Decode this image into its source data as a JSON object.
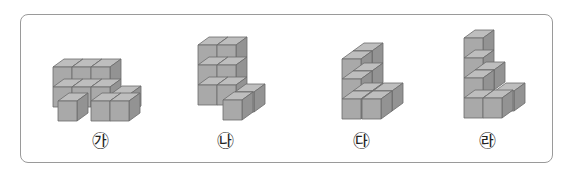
{
  "figures": [
    {
      "label": "㉮",
      "label_x": 100,
      "cubes": [
        {
          "x": 53,
          "y": 67
        },
        {
          "x": 72,
          "y": 67
        },
        {
          "x": 91,
          "y": 67
        },
        {
          "x": 53,
          "y": 87
        },
        {
          "x": 72,
          "y": 87
        },
        {
          "x": 91,
          "y": 87
        },
        {
          "x": 111,
          "y": 94
        },
        {
          "x": 58,
          "y": 101
        },
        {
          "x": 91,
          "y": 101
        },
        {
          "x": 110,
          "y": 101
        }
      ]
    },
    {
      "label": "㉯",
      "label_x": 225,
      "cubes": [
        {
          "x": 198,
          "y": 45
        },
        {
          "x": 217,
          "y": 45
        },
        {
          "x": 198,
          "y": 65
        },
        {
          "x": 217,
          "y": 65
        },
        {
          "x": 198,
          "y": 85
        },
        {
          "x": 217,
          "y": 85
        },
        {
          "x": 235,
          "y": 92
        },
        {
          "x": 223,
          "y": 100
        }
      ]
    },
    {
      "label": "㉰",
      "label_x": 361,
      "cubes": [
        {
          "x": 353,
          "y": 51
        },
        {
          "x": 342,
          "y": 59
        },
        {
          "x": 353,
          "y": 71
        },
        {
          "x": 342,
          "y": 79
        },
        {
          "x": 353,
          "y": 91
        },
        {
          "x": 373,
          "y": 91
        },
        {
          "x": 342,
          "y": 99
        },
        {
          "x": 362,
          "y": 99
        }
      ]
    },
    {
      "label": "㉱",
      "label_x": 487,
      "cubes": [
        {
          "x": 464,
          "y": 38
        },
        {
          "x": 464,
          "y": 58
        },
        {
          "x": 475,
          "y": 70
        },
        {
          "x": 464,
          "y": 78
        },
        {
          "x": 495,
          "y": 91
        },
        {
          "x": 464,
          "y": 98
        },
        {
          "x": 483,
          "y": 98
        }
      ]
    }
  ],
  "colors": {
    "front": "#a9a9a9",
    "top": "#bebebe",
    "side": "#939393",
    "edge": "#6b6b6b",
    "frame": "#9a9a9a"
  },
  "cube": {
    "w": 19,
    "h": 20,
    "dx": 11,
    "dy": -8
  }
}
